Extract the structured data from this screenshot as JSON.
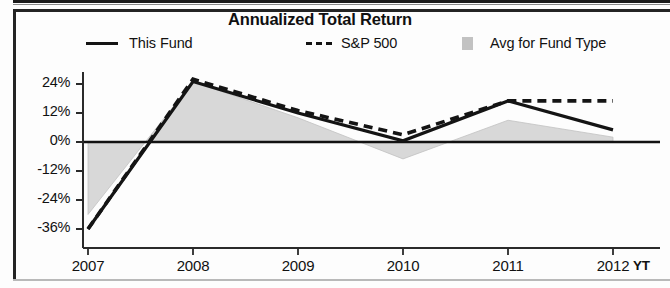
{
  "panel": {
    "title": "Annualized Total Return"
  },
  "legend": {
    "position": "top",
    "items": [
      {
        "label": "This Fund",
        "marker": "solid-line-swatch",
        "color": "#141414"
      },
      {
        "label": "S&P 500",
        "marker": "dashed-line-swatch",
        "color": "#141414"
      },
      {
        "label": "Avg for Fund Type",
        "marker": "filled-square-swatch",
        "color": "#c2c2c2"
      }
    ]
  },
  "axes": {
    "y_ticks": [
      "24%",
      "12%",
      "0%",
      "-12%",
      "-24%",
      "-36%"
    ],
    "x_ticks": [
      "2007",
      "2008",
      "2009",
      "2010",
      "2011",
      "2012"
    ],
    "x_ytd_label": "YT"
  },
  "chart_data": {
    "type": "line",
    "title": "Annualized Total Return",
    "xlabel": "",
    "ylabel": "",
    "categories": [
      "2007",
      "2008",
      "2009",
      "2010",
      "2011",
      "2012"
    ],
    "ylim": [
      -40,
      28
    ],
    "yticks": [
      24,
      12,
      0,
      -12,
      -24,
      -36
    ],
    "ytick_labels": [
      "24%",
      "12%",
      "0%",
      "-12%",
      "-24%",
      "-36%"
    ],
    "grid": false,
    "zero_line": true,
    "legend_position": "top",
    "series": [
      {
        "name": "This Fund",
        "style": "solid",
        "color": "#141414",
        "values": [
          -36,
          25,
          12,
          0.5,
          17,
          5
        ]
      },
      {
        "name": "S&P 500",
        "style": "dashed",
        "color": "#141414",
        "values": [
          -36,
          26,
          13,
          3,
          17,
          17
        ]
      },
      {
        "name": "Avg for Fund Type",
        "style": "filled-area",
        "color": "#c2c2c2",
        "values": [
          -30,
          25,
          10,
          -7,
          9,
          2
        ]
      }
    ]
  }
}
